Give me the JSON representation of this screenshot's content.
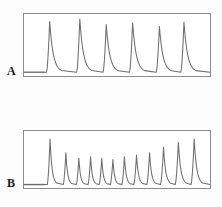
{
  "figure": {
    "width": 222,
    "height": 207,
    "background_color": "#fdfdfd",
    "panel_border_color": "#8c8c8c",
    "trace_color": "#6e6e6e",
    "label_color": "#1a1a1a"
  },
  "panels": [
    {
      "id": "A",
      "label": "A",
      "frame": {
        "x": 23,
        "y": 13,
        "width": 188,
        "height": 64
      }
    },
    {
      "id": "B",
      "label": "B",
      "frame": {
        "x": 23,
        "y": 130,
        "width": 188,
        "height": 59
      }
    }
  ],
  "chart_data": [
    {
      "type": "line",
      "title": "A",
      "xlabel": "",
      "ylabel": "",
      "xlim": [
        0,
        100
      ],
      "ylim": [
        0,
        100
      ],
      "grid": false,
      "legend": null,
      "axis_ticks": false,
      "baseline": 6,
      "lead_in_end": 11,
      "series": [
        {
          "name": "trace-a",
          "peak_positions": [
            13.8,
            30.0,
            44.2,
            58.4,
            72.8,
            86.0
          ],
          "peak_heights": [
            88,
            92,
            83,
            86,
            80,
            87
          ],
          "peak_widths": [
            1.7,
            1.7,
            1.7,
            1.7,
            1.7,
            1.7
          ],
          "decay_widths": [
            6.5,
            6.5,
            6.5,
            6.5,
            6.5,
            6.5
          ]
        }
      ]
    },
    {
      "type": "line",
      "title": "B",
      "xlabel": "",
      "ylabel": "",
      "xlim": [
        0,
        100
      ],
      "ylim": [
        0,
        100
      ],
      "grid": false,
      "legend": null,
      "axis_ticks": false,
      "baseline": 6,
      "lead_in_end": 11,
      "series": [
        {
          "name": "trace-b",
          "peak_positions": [
            14.0,
            22.5,
            29.5,
            35.8,
            41.8,
            47.8,
            54.0,
            60.5,
            67.5,
            75.0,
            83.0,
            91.5
          ],
          "peak_heights": [
            86,
            62,
            52,
            55,
            52,
            50,
            55,
            58,
            62,
            72,
            80,
            86
          ],
          "peak_widths": [
            1.5,
            1.4,
            1.4,
            1.4,
            1.4,
            1.4,
            1.4,
            1.5,
            1.5,
            1.6,
            1.7,
            1.7
          ],
          "decay_widths": [
            3.6,
            3.2,
            3.0,
            3.0,
            3.0,
            3.0,
            3.2,
            3.4,
            3.6,
            4.0,
            4.4,
            4.6
          ]
        }
      ]
    }
  ]
}
